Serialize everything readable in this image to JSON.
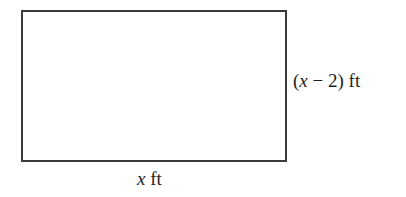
{
  "diagram": {
    "shape": "rectangle",
    "colors": {
      "stroke": "#3a3a3a",
      "text": "#1e1e1e",
      "background": "#ffffff"
    },
    "side_label": {
      "open": "(",
      "variable": "x",
      "rest": " − 2) ft"
    },
    "bottom_label": {
      "variable": "x",
      "rest": " ft"
    }
  }
}
